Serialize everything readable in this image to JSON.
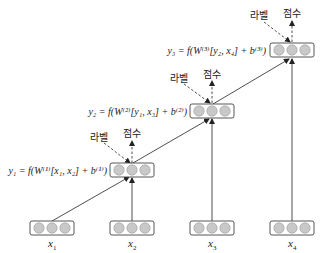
{
  "diagram": {
    "type": "recursive-neural-network",
    "inputs": [
      {
        "label": "x",
        "sub": "1"
      },
      {
        "label": "x",
        "sub": "2"
      },
      {
        "label": "x",
        "sub": "3"
      },
      {
        "label": "x",
        "sub": "4"
      }
    ],
    "hidden": [
      {
        "equation": "y₁ = f(W⁽¹⁾[x₁, x₂] + b⁽¹⁾)",
        "label_text": "라벨",
        "score_text": "점수"
      },
      {
        "equation": "y₂ = f(W⁽²⁾[y₁, x₃] + b⁽²⁾)",
        "label_text": "라벨",
        "score_text": "점수"
      },
      {
        "equation": "y₃ = f(W⁽³⁾[y₂, x₄] + b⁽³⁾)",
        "label_text": "라벨",
        "score_text": "점수"
      }
    ],
    "colors": {
      "node_fill": "#c8c8c8",
      "node_stroke": "#9a9a9a",
      "box_stroke": "#444444",
      "line": "#222222"
    }
  }
}
